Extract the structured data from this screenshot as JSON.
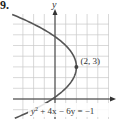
{
  "problem": {
    "number": "9."
  },
  "colors": {
    "grid": "#c8c8c8",
    "axis": "#333333",
    "curve": "#555555",
    "point": "#444444",
    "text": "#333333"
  },
  "chart_data": {
    "type": "line",
    "title": "",
    "xlabel": "",
    "ylabel": "y",
    "equation": "y² + 4x − 6y = −1",
    "equation_parts": {
      "y2": "y",
      "sup": "2",
      "rest": " + 4x − 6y = −1"
    },
    "curve": "parabola opening left, x = 2 − (y − 3)²/4",
    "vertex": {
      "x": 2,
      "y": 3,
      "label": "(2, 3)"
    },
    "xlim": [
      -4,
      5
    ],
    "ylim": [
      -2,
      8
    ],
    "grid": true,
    "series": [
      {
        "name": "y² + 4x − 6y = −1",
        "points": [
          [
            -4.25,
            8
          ],
          [
            -2,
            7
          ],
          [
            -0.25,
            6
          ],
          [
            1,
            5
          ],
          [
            1.75,
            4
          ],
          [
            2,
            3
          ],
          [
            1.75,
            2
          ],
          [
            1,
            1
          ],
          [
            -0.25,
            0
          ],
          [
            -2,
            -1
          ],
          [
            -4.25,
            -2
          ]
        ]
      }
    ]
  }
}
